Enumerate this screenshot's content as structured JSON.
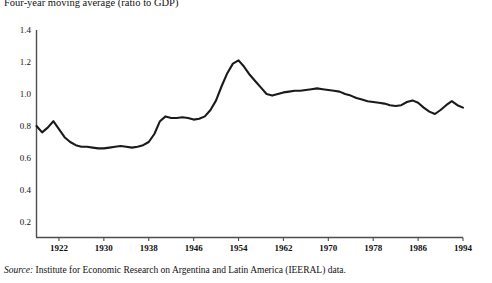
{
  "figure": {
    "title": "Four-year moving average (ratio to GDP)",
    "source_label": "Source:",
    "source_text": "Institute for Economic Research on Argentina and Latin America (IEERAL) data.",
    "line_color": "#1a1a1a",
    "axis_color": "#4d4d4d"
  },
  "chart_data": {
    "type": "line",
    "title": "Four-year moving average (ratio to GDP)",
    "xlabel": "",
    "ylabel": "",
    "xlim": [
      1918,
      1994
    ],
    "ylim": [
      0,
      1.4
    ],
    "grid": false,
    "legend": "none",
    "yticks": [
      "0",
      "0.2",
      "0.4",
      "0.6",
      "0.8",
      "1.0",
      "1.2",
      "1.4"
    ],
    "ytick_values": [
      0,
      0.2,
      0.4,
      0.6,
      0.8,
      1.0,
      1.2,
      1.4
    ],
    "xticks": [
      "1922",
      "1930",
      "1938",
      "1946",
      "1954",
      "1962",
      "1970",
      "1978",
      "1986",
      "1994"
    ],
    "xtick_values": [
      1922,
      1930,
      1938,
      1946,
      1954,
      1962,
      1970,
      1978,
      1986,
      1994
    ],
    "series": [
      {
        "name": "Four-year moving average (ratio to GDP)",
        "x": [
          1918,
          1919,
          1920,
          1921,
          1922,
          1923,
          1924,
          1925,
          1926,
          1927,
          1928,
          1929,
          1930,
          1931,
          1932,
          1933,
          1934,
          1935,
          1936,
          1937,
          1938,
          1939,
          1940,
          1941,
          1942,
          1943,
          1944,
          1945,
          1946,
          1947,
          1948,
          1949,
          1950,
          1951,
          1952,
          1953,
          1954,
          1955,
          1956,
          1957,
          1958,
          1959,
          1960,
          1961,
          1962,
          1963,
          1964,
          1965,
          1966,
          1967,
          1968,
          1969,
          1970,
          1971,
          1972,
          1973,
          1974,
          1975,
          1976,
          1977,
          1978,
          1979,
          1980,
          1981,
          1982,
          1983,
          1984,
          1985,
          1986,
          1987,
          1988,
          1989,
          1990,
          1991,
          1992,
          1993,
          1994
        ],
        "values": [
          0.8,
          0.76,
          0.79,
          0.83,
          0.78,
          0.73,
          0.7,
          0.68,
          0.67,
          0.67,
          0.665,
          0.66,
          0.66,
          0.665,
          0.67,
          0.675,
          0.67,
          0.665,
          0.67,
          0.68,
          0.7,
          0.75,
          0.83,
          0.86,
          0.85,
          0.85,
          0.855,
          0.85,
          0.84,
          0.845,
          0.86,
          0.9,
          0.96,
          1.05,
          1.13,
          1.19,
          1.21,
          1.17,
          1.12,
          1.08,
          1.04,
          1.0,
          0.99,
          1.0,
          1.01,
          1.015,
          1.02,
          1.02,
          1.025,
          1.03,
          1.035,
          1.03,
          1.025,
          1.02,
          1.015,
          1.0,
          0.99,
          0.975,
          0.965,
          0.955,
          0.95,
          0.945,
          0.94,
          0.93,
          0.925,
          0.93,
          0.95,
          0.96,
          0.945,
          0.915,
          0.89,
          0.875,
          0.9,
          0.93,
          0.955,
          0.93,
          0.915
        ]
      }
    ]
  }
}
